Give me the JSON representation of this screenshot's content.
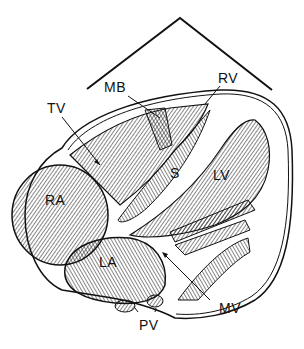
{
  "diagram": {
    "labels": {
      "tv": "TV",
      "mb": "MB",
      "rv": "RV",
      "s": "S",
      "lv": "LV",
      "ra": "RA",
      "la": "LA",
      "mv": "MV",
      "pv": "PV"
    },
    "colors": {
      "line": "#111111",
      "background": "#ffffff"
    }
  }
}
